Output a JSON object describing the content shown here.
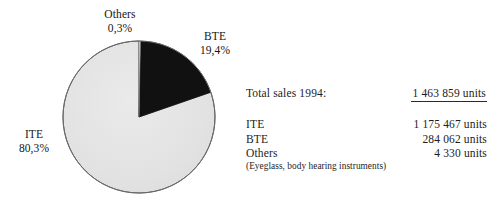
{
  "chart_data": {
    "type": "pie",
    "title": "",
    "subtitle": "",
    "xlabel": "",
    "ylabel": "",
    "grid": false,
    "legend_position": "callout-labels",
    "start_angle_deg": 0,
    "direction": "clockwise",
    "categories": [
      "BTE",
      "ITE",
      "Others"
    ],
    "values": [
      19.4,
      80.3,
      0.3
    ],
    "unit": "%",
    "labels": [
      "19,4%",
      "80,3%",
      "0,3%"
    ],
    "counts": [
      284062,
      1175467,
      4330
    ],
    "colors": [
      "#111111",
      "#e3e3e3",
      "#ffffff"
    ],
    "slice_outline_color": "#5a5a5a",
    "annotations": [
      {
        "name": "Others",
        "percent": "0,3%"
      },
      {
        "name": "BTE",
        "percent": "19,4%"
      },
      {
        "name": "ITE",
        "percent": "80,3%"
      }
    ]
  },
  "pie_labels": {
    "others": {
      "name": "Others",
      "percent": "0,3%"
    },
    "bte": {
      "name": "BTE",
      "percent": "19,4%"
    },
    "ite": {
      "name": "ITE",
      "percent": "80,3%"
    }
  },
  "stats": {
    "total": {
      "label": "Total sales 1994:",
      "value": "1 463 859 units"
    },
    "rows": [
      {
        "label": "ITE",
        "value": "1 175 467 units"
      },
      {
        "label": "BTE",
        "value": "284 062 units"
      },
      {
        "label": "Others",
        "value": "4 330 units"
      }
    ],
    "footnote": "(Eyeglass, body hearing instruments)"
  },
  "style": {
    "background": "#ffffff",
    "text_color": "#1c1c1c",
    "dark_slice": "#111111",
    "light_slice": "#e3e3e3",
    "outline": "#5a5a5a"
  }
}
